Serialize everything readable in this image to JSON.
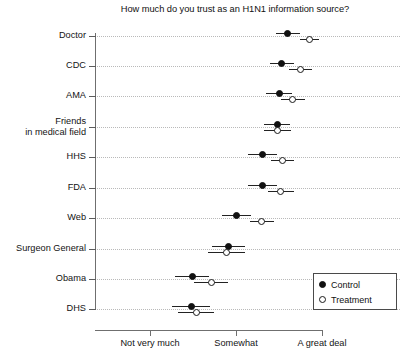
{
  "chart_data": {
    "type": "scatter",
    "title": "How much do you trust as an H1N1 information source?",
    "xlabel": "",
    "ylabel": "",
    "grid": true,
    "legend_position": "bottom-right",
    "xtick_labels": [
      "Not very much",
      "Somewhat",
      "A great deal"
    ],
    "xtick_values": [
      1,
      2,
      3
    ],
    "xlim": [
      0.36,
      3.02
    ],
    "categories": [
      "Doctor",
      "CDC",
      "AMA",
      "Friends\nin medical field",
      "HHS",
      "FDA",
      "Web",
      "Surgeon General",
      "Obama",
      "DHS"
    ],
    "series": [
      {
        "name": "Control",
        "marker": "filled-circle",
        "values": [
          2.6,
          2.53,
          2.5,
          2.48,
          2.31,
          2.31,
          2.01,
          1.91,
          1.49,
          1.48
        ],
        "ci_low": [
          2.46,
          2.39,
          2.35,
          2.33,
          2.14,
          2.14,
          1.84,
          1.72,
          1.29,
          1.26
        ],
        "ci_high": [
          2.74,
          2.67,
          2.65,
          2.63,
          2.48,
          2.48,
          2.18,
          2.1,
          1.69,
          1.7
        ]
      },
      {
        "name": "Treatment",
        "marker": "open-circle",
        "values": [
          2.85,
          2.75,
          2.66,
          2.48,
          2.54,
          2.52,
          2.3,
          1.89,
          1.71,
          1.54
        ],
        "ci_low": [
          2.74,
          2.62,
          2.52,
          2.32,
          2.41,
          2.37,
          2.16,
          1.68,
          1.51,
          1.33
        ],
        "ci_high": [
          2.96,
          2.88,
          2.8,
          2.64,
          2.67,
          2.67,
          2.44,
          2.1,
          1.91,
          1.75
        ]
      }
    ],
    "legend_entries": [
      "Control",
      "Treatment"
    ],
    "colors": {
      "control": "#111111",
      "treatment": "#ffffff",
      "marker_outline": "#1a1a1a",
      "grid": "#b9b9b9",
      "axis": "#6f6f6f"
    }
  }
}
